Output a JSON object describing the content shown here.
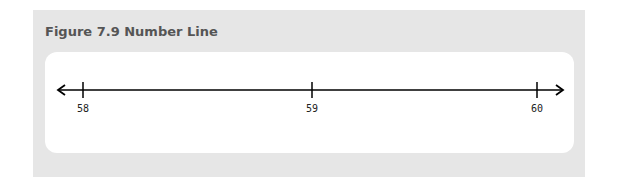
{
  "figure": {
    "title": "Figure 7.9 Number Line"
  },
  "number_line": {
    "ticks": [
      {
        "value": 58,
        "label": "58"
      },
      {
        "value": 59,
        "label": "59"
      },
      {
        "value": 60,
        "label": "60"
      }
    ],
    "arrows": "both",
    "line_color": "#000000"
  },
  "colors": {
    "panel_background": "#e6e6e6",
    "card_background": "#ffffff",
    "title_color": "#555555"
  }
}
